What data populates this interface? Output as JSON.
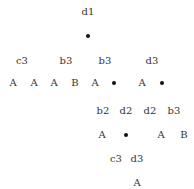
{
  "tree": {
    "nodes": [
      {
        "id": "n0",
        "label": "d1",
        "x": 88,
        "y": 12
      },
      {
        "id": "n1",
        "label": "•",
        "x": 88,
        "y": 36,
        "kind": "dot"
      },
      {
        "id": "n2",
        "label": "c3",
        "x": 22,
        "y": 61
      },
      {
        "id": "n3",
        "label": "b3",
        "x": 66,
        "y": 61
      },
      {
        "id": "n4",
        "label": "b3",
        "x": 105,
        "y": 61
      },
      {
        "id": "n5",
        "label": "d3",
        "x": 152,
        "y": 61
      },
      {
        "id": "n6",
        "label": "A",
        "x": 13,
        "y": 83
      },
      {
        "id": "n7",
        "label": "A",
        "x": 34,
        "y": 83
      },
      {
        "id": "n8",
        "label": "A",
        "x": 54,
        "y": 83
      },
      {
        "id": "n9",
        "label": "B",
        "x": 75,
        "y": 83
      },
      {
        "id": "n10",
        "label": "A",
        "x": 95,
        "y": 83
      },
      {
        "id": "n11",
        "label": "•",
        "x": 114,
        "y": 83,
        "kind": "dot"
      },
      {
        "id": "n12",
        "label": "A",
        "x": 142,
        "y": 83
      },
      {
        "id": "n13",
        "label": "•",
        "x": 162,
        "y": 83,
        "kind": "dot"
      },
      {
        "id": "n14",
        "label": "b2",
        "x": 103,
        "y": 111
      },
      {
        "id": "n15",
        "label": "d2",
        "x": 126,
        "y": 111
      },
      {
        "id": "n16",
        "label": "d2",
        "x": 150,
        "y": 111
      },
      {
        "id": "n17",
        "label": "b3",
        "x": 174,
        "y": 111
      },
      {
        "id": "n18",
        "label": "A",
        "x": 102,
        "y": 135
      },
      {
        "id": "n19",
        "label": "•",
        "x": 126,
        "y": 135,
        "kind": "dot"
      },
      {
        "id": "n20",
        "label": "A",
        "x": 161,
        "y": 135
      },
      {
        "id": "n21",
        "label": "B",
        "x": 184,
        "y": 135
      },
      {
        "id": "n22",
        "label": "c3",
        "x": 116,
        "y": 159
      },
      {
        "id": "n23",
        "label": "d3",
        "x": 137,
        "y": 159
      },
      {
        "id": "n24",
        "label": "A",
        "x": 137,
        "y": 183
      }
    ]
  }
}
